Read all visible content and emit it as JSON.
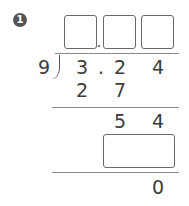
{
  "problem": {
    "number": "1",
    "divisor": "9",
    "dividend": {
      "d1": "3",
      "point": ".",
      "d2": "2",
      "d3": "4"
    },
    "quotient_boxes": [
      "",
      "",
      ""
    ],
    "step1_product": {
      "d1": "2",
      "d2": "7"
    },
    "step1_remainder": {
      "d1": "5",
      "d2": "4"
    },
    "step2_product_box": "",
    "final_remainder": "0"
  }
}
